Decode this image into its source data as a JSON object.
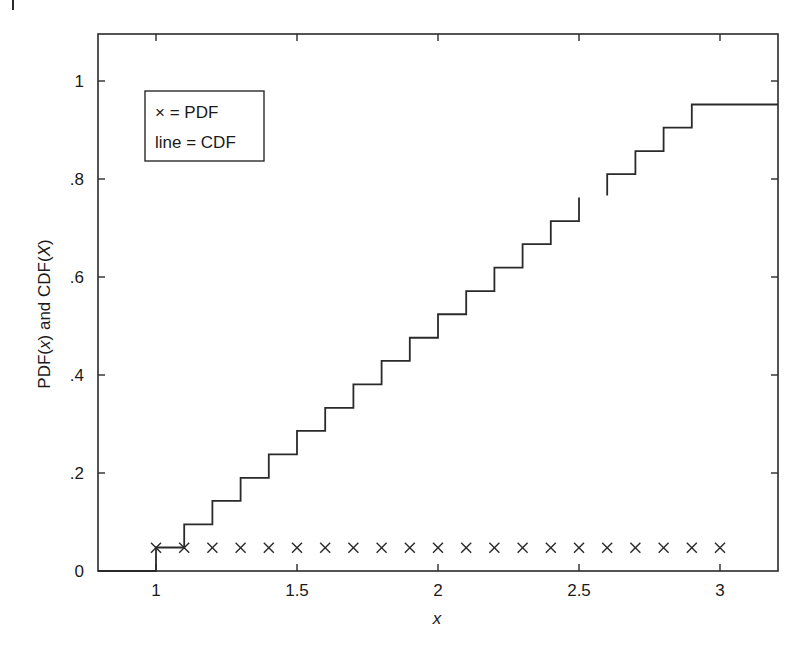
{
  "chart_data": {
    "type": "line",
    "title": "",
    "xlabel": "x",
    "ylabel": "PDF(x) and CDF(X)",
    "xlim": [
      0.79,
      3.2
    ],
    "ylim": [
      0,
      1.1
    ],
    "grid": false,
    "legend_position": "upper-left (inside)",
    "legend": [
      "× = PDF",
      "line = CDF"
    ],
    "x_ticks": [
      1,
      1.5,
      2,
      2.5,
      3
    ],
    "x_tick_labels": [
      "1",
      "1.5",
      "2",
      "2.5",
      "3"
    ],
    "y_ticks": [
      0,
      0.2,
      0.4,
      0.6,
      0.8,
      1
    ],
    "y_tick_labels": [
      "0",
      ".2",
      ".4",
      ".6",
      ".8",
      "1"
    ],
    "series": [
      {
        "name": "PDF",
        "style": "markers-x",
        "x": [
          1.0,
          1.1,
          1.2,
          1.3,
          1.4,
          1.5,
          1.6,
          1.7,
          1.8,
          1.9,
          2.0,
          2.1,
          2.2,
          2.3,
          2.4,
          2.5,
          2.6,
          2.7,
          2.8,
          2.9,
          3.0
        ],
        "values": [
          0.0476,
          0.0476,
          0.0476,
          0.0476,
          0.0476,
          0.0476,
          0.0476,
          0.0476,
          0.0476,
          0.0476,
          0.0476,
          0.0476,
          0.0476,
          0.0476,
          0.0476,
          0.0476,
          0.0476,
          0.0476,
          0.0476,
          0.0476,
          0.0476
        ]
      },
      {
        "name": "CDF",
        "style": "step",
        "x": [
          1.0,
          1.1,
          1.2,
          1.3,
          1.4,
          1.5,
          1.6,
          1.7,
          1.8,
          1.9,
          2.0,
          2.1,
          2.2,
          2.3,
          2.4,
          2.5,
          2.6,
          2.7,
          2.8,
          2.9
        ],
        "values": [
          0.048,
          0.095,
          0.143,
          0.19,
          0.238,
          0.286,
          0.333,
          0.381,
          0.429,
          0.476,
          0.524,
          0.571,
          0.619,
          0.667,
          0.714,
          0.762,
          0.81,
          0.857,
          0.905,
          0.952
        ],
        "start_level": 0,
        "gap_between": [
          2.5,
          2.6
        ]
      }
    ]
  },
  "colors": {
    "line": "#2a2a2a",
    "frame": "#2a2a2a",
    "background": "#ffffff"
  }
}
